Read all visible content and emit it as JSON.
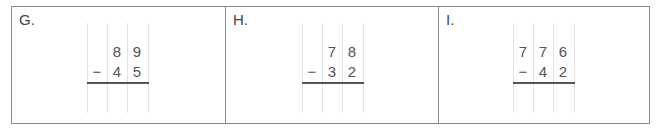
{
  "problems": [
    {
      "label": "G.",
      "operator": "−",
      "columns": 3,
      "top_row": [
        "",
        "8",
        "9"
      ],
      "bottom_row": [
        "−",
        "4",
        "5"
      ]
    },
    {
      "label": "H.",
      "operator": "−",
      "columns": 3,
      "top_row": [
        "",
        "7",
        "8"
      ],
      "bottom_row": [
        "−",
        "3",
        "2"
      ]
    },
    {
      "label": "I.",
      "operator": "−",
      "columns": 3,
      "top_row": [
        "7",
        "7",
        "6"
      ],
      "bottom_row": [
        "−",
        "4",
        "2"
      ]
    }
  ]
}
